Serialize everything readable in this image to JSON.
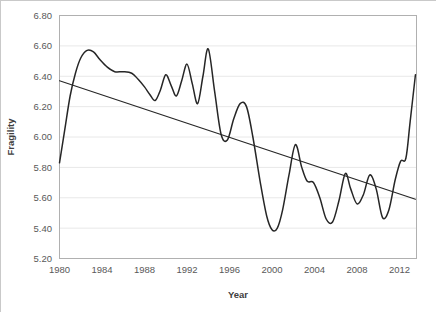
{
  "chart_data": {
    "type": "line",
    "title": "",
    "subtitle": "",
    "xlabel": "Year",
    "ylabel": "Fragility",
    "xlim": [
      1980,
      2013.6
    ],
    "ylim": [
      5.2,
      6.8
    ],
    "ytick_labels": [
      "6.80",
      "6.60",
      "6.40",
      "6.20",
      "6.00",
      "5.80",
      "5.60",
      "5.40",
      "5.20"
    ],
    "ytick_values": [
      6.8,
      6.6,
      6.4,
      6.2,
      6.0,
      5.8,
      5.6,
      5.4,
      5.2
    ],
    "xtick_labels": [
      "1980",
      "1984",
      "1988",
      "1992",
      "1996",
      "2000",
      "2004",
      "2008",
      "2012"
    ],
    "xtick_values": [
      1980,
      1984,
      1988,
      1992,
      1996,
      2000,
      2004,
      2008,
      2012
    ],
    "grid": "horizontal",
    "legend": "none",
    "series": [
      {
        "name": "Fragility",
        "color": "#262626",
        "style": "smooth-line",
        "x": [
          1980.0,
          1980.5,
          1981.0,
          1981.5,
          1982.0,
          1982.6,
          1983.2,
          1983.8,
          1984.5,
          1985.2,
          1986.0,
          1986.8,
          1987.4,
          1988.0,
          1988.5,
          1989.0,
          1989.5,
          1990.0,
          1990.5,
          1991.0,
          1991.5,
          1992.0,
          1992.5,
          1993.0,
          1993.5,
          1994.0,
          1994.6,
          1995.2,
          1995.8,
          1996.4,
          1997.0,
          1997.6,
          1998.2,
          1998.9,
          1999.5,
          2000.0,
          2000.5,
          2001.0,
          2001.6,
          2002.2,
          2002.8,
          2003.3,
          2003.9,
          2004.5,
          2005.1,
          2005.7,
          2006.3,
          2006.9,
          2007.4,
          2008.0,
          2008.6,
          2009.2,
          2009.8,
          2010.4,
          2011.0,
          2011.6,
          2012.1,
          2012.6,
          2013.0,
          2013.5
        ],
        "y": [
          5.83,
          6.05,
          6.27,
          6.42,
          6.52,
          6.57,
          6.56,
          6.51,
          6.46,
          6.43,
          6.43,
          6.42,
          6.38,
          6.33,
          6.28,
          6.24,
          6.31,
          6.41,
          6.34,
          6.27,
          6.37,
          6.48,
          6.35,
          6.22,
          6.4,
          6.58,
          6.3,
          6.02,
          5.98,
          6.12,
          6.22,
          6.2,
          6.0,
          5.7,
          5.48,
          5.39,
          5.4,
          5.52,
          5.75,
          5.95,
          5.8,
          5.71,
          5.7,
          5.6,
          5.46,
          5.44,
          5.58,
          5.76,
          5.66,
          5.56,
          5.62,
          5.75,
          5.66,
          5.47,
          5.52,
          5.72,
          5.84,
          5.86,
          6.1,
          6.41
        ],
        "notes": "declining oscillatory series with sharp 1992 peak, 1997-98 trough and late-period rebound"
      },
      {
        "name": "Linear trend",
        "color": "#262626",
        "style": "straight-line",
        "x": [
          1980.0,
          2013.5
        ],
        "y": [
          6.37,
          5.59
        ]
      }
    ]
  },
  "axis": {
    "y_title": "Fragility",
    "x_title": "Year"
  }
}
